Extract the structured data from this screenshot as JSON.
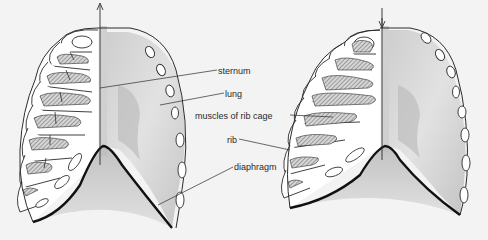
{
  "figure": {
    "background": "#f3f3f3",
    "panels": [
      {
        "name": "inhalation",
        "arrow_direction": "up",
        "description": "rib cage raised, diaphragm lowered"
      },
      {
        "name": "exhalation",
        "arrow_direction": "down",
        "description": "rib cage lowered, diaphragm raised"
      }
    ],
    "labels": {
      "sternum": "sternum",
      "lung": "lung",
      "muscles": "muscles of rib cage",
      "rib": "rib",
      "diaphragm": "diaphragm"
    },
    "colors": {
      "outline": "#2b2b2b",
      "diaphragm_line": "#111111",
      "lung_light": "#e6e6e6",
      "lung_mid": "#cfcfcf",
      "lung_dark": "#b5b5b5",
      "bone": "#ffffff",
      "hatch": "#555555"
    }
  }
}
